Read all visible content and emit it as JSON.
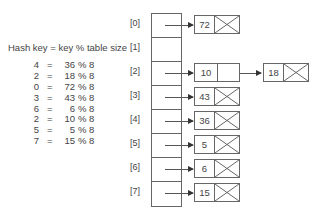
{
  "formula": {
    "title": "Hash key = key % table size",
    "equations": [
      {
        "hash": "4",
        "eq": "=",
        "key": "36",
        "mod": "% 8"
      },
      {
        "hash": "2",
        "eq": "=",
        "key": "18",
        "mod": "% 8"
      },
      {
        "hash": "0",
        "eq": "=",
        "key": "72",
        "mod": "% 8"
      },
      {
        "hash": "3",
        "eq": "=",
        "key": "43",
        "mod": "% 8"
      },
      {
        "hash": "6",
        "eq": "=",
        "key": "6",
        "mod": "% 8"
      },
      {
        "hash": "2",
        "eq": "=",
        "key": "10",
        "mod": "% 8"
      },
      {
        "hash": "5",
        "eq": "=",
        "key": "5",
        "mod": "% 8"
      },
      {
        "hash": "7",
        "eq": "=",
        "key": "15",
        "mod": "% 8"
      }
    ]
  },
  "table": {
    "indices": [
      "[0]",
      "[1]",
      "[2]",
      "[3]",
      "[4]",
      "[5]",
      "[6]",
      "[7]"
    ],
    "chains": [
      {
        "slot": 0,
        "nodes": [
          "72"
        ]
      },
      {
        "slot": 1,
        "nodes": []
      },
      {
        "slot": 2,
        "nodes": [
          "10",
          "18"
        ]
      },
      {
        "slot": 3,
        "nodes": [
          "43"
        ]
      },
      {
        "slot": 4,
        "nodes": [
          "36"
        ]
      },
      {
        "slot": 5,
        "nodes": [
          "5"
        ]
      },
      {
        "slot": 6,
        "nodes": [
          "6"
        ]
      },
      {
        "slot": 7,
        "nodes": [
          "15"
        ]
      }
    ],
    "null_symbol": "X"
  }
}
